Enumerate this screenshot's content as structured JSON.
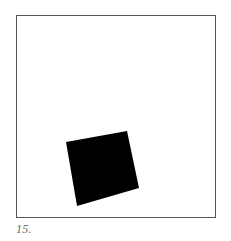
{
  "figure": {
    "label": "15.",
    "frame": {
      "x": 16,
      "y": 15,
      "width": 199,
      "height": 202,
      "stroke": "#555555",
      "stroke_width": 1,
      "fill": "#ffffff"
    },
    "shape": {
      "type": "rotated-square",
      "fill": "#000000",
      "points": "66,142 127,131 139,188 77,206"
    }
  }
}
